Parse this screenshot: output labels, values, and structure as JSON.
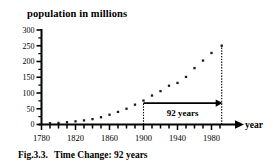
{
  "figure": {
    "axis_title": "population in millions",
    "caption_label": "Fig.3.3.",
    "caption_text": "Time Change: 92 years",
    "x_axis_end_label": "year",
    "annotation_label": "92 years"
  },
  "chart_data": {
    "type": "scatter",
    "title": "population in millions",
    "xlabel": "year",
    "ylabel": "population in millions",
    "xlim": [
      1780,
      2000
    ],
    "ylim": [
      0,
      300
    ],
    "grid": false,
    "legend": null,
    "xticks": [
      1780,
      1790,
      1800,
      1810,
      1820,
      1830,
      1840,
      1850,
      1860,
      1870,
      1880,
      1890,
      1900,
      1910,
      1920,
      1930,
      1940,
      1950,
      1960,
      1970,
      1980,
      1990
    ],
    "xtick_labels": [
      "1780",
      "",
      "",
      "",
      "1820",
      "",
      "",
      "",
      "1860",
      "",
      "",
      "",
      "1900",
      "",
      "",
      "",
      "1940",
      "",
      "",
      "",
      "1980",
      ""
    ],
    "yticks": [
      0,
      50,
      100,
      150,
      200,
      250,
      300
    ],
    "ytick_labels": [
      "0",
      "50",
      "100",
      "150",
      "200",
      "250",
      "300"
    ],
    "y_minor_ticks": [
      25,
      75,
      125,
      175,
      225,
      275
    ],
    "x": [
      1790,
      1800,
      1810,
      1820,
      1830,
      1840,
      1850,
      1860,
      1870,
      1880,
      1890,
      1900,
      1910,
      1920,
      1930,
      1940,
      1950,
      1960,
      1970,
      1980,
      1992
    ],
    "values": [
      4,
      5,
      7,
      10,
      13,
      17,
      23,
      31,
      40,
      50,
      63,
      76,
      92,
      106,
      123,
      132,
      151,
      179,
      203,
      227,
      250
    ],
    "series": [
      {
        "name": "population",
        "marker": "square-dot",
        "color": "#1a1a1a",
        "points": [
          {
            "year": 1790,
            "population": 4
          },
          {
            "year": 1800,
            "population": 5
          },
          {
            "year": 1810,
            "population": 7
          },
          {
            "year": 1820,
            "population": 10
          },
          {
            "year": 1830,
            "population": 13
          },
          {
            "year": 1840,
            "population": 17
          },
          {
            "year": 1850,
            "population": 23
          },
          {
            "year": 1860,
            "population": 31
          },
          {
            "year": 1870,
            "population": 40
          },
          {
            "year": 1880,
            "population": 50
          },
          {
            "year": 1890,
            "population": 63
          },
          {
            "year": 1900,
            "population": 76
          },
          {
            "year": 1910,
            "population": 92
          },
          {
            "year": 1920,
            "population": 106
          },
          {
            "year": 1930,
            "population": 123
          },
          {
            "year": 1940,
            "population": 132
          },
          {
            "year": 1950,
            "population": 151
          },
          {
            "year": 1960,
            "population": 179
          },
          {
            "year": 1970,
            "population": 203
          },
          {
            "year": 1980,
            "population": 227
          },
          {
            "year": 1992,
            "population": 250
          }
        ]
      }
    ],
    "annotations": [
      {
        "type": "span-arrow",
        "label": "92 years",
        "x_start": 1900,
        "x_end": 1992,
        "y": 68
      },
      {
        "type": "vline-dotted",
        "x": 1900,
        "y_start": 0,
        "y_end": 68
      },
      {
        "type": "vline-dotted",
        "x": 1992,
        "y_start": 0,
        "y_end": 255
      }
    ]
  },
  "colors": {
    "ink": "#000000",
    "marker": "#1a1a1a",
    "background": "#ffffff"
  }
}
